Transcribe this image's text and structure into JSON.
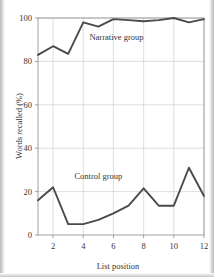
{
  "chart_data": {
    "type": "line",
    "title": "",
    "xlabel": "List position",
    "ylabel": "Words recalled (%)",
    "xlim": [
      1,
      12
    ],
    "ylim": [
      0,
      100
    ],
    "grid": true,
    "legend_position": "inline-annotations",
    "x": [
      1,
      2,
      3,
      4,
      5,
      6,
      7,
      8,
      9,
      10,
      11,
      12
    ],
    "xticks": [
      "2",
      "4",
      "6",
      "8",
      "10",
      "12"
    ],
    "xtick_values": [
      2,
      4,
      6,
      8,
      10,
      12
    ],
    "yticks": [
      "0",
      "20",
      "40",
      "60",
      "80",
      "100"
    ],
    "ytick_values": [
      0,
      20,
      40,
      60,
      80,
      100
    ],
    "series": [
      {
        "name": "Narrative group",
        "label": "Narrative group",
        "color": "#4a4a4a",
        "values": [
          83,
          87,
          83.5,
          98,
          96,
          99.5,
          99,
          98.5,
          99,
          100,
          98,
          99.5
        ]
      },
      {
        "name": "Control group",
        "label": "Control group",
        "color": "#4a4a4a",
        "values": [
          16,
          22,
          5,
          5,
          7,
          10,
          13.5,
          21.5,
          13.5,
          13.5,
          31,
          18
        ]
      }
    ],
    "annotations": [
      {
        "text": "Narrative group",
        "x": 6.2,
        "y": 90
      },
      {
        "text": "Control group",
        "x": 5.0,
        "y": 26
      }
    ]
  }
}
